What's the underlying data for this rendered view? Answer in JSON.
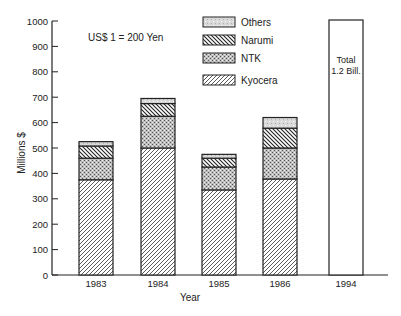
{
  "chart_data": {
    "type": "bar",
    "stacked": true,
    "title": "",
    "annotation": "US$ 1 = 200 Yen",
    "xlabel": "Year",
    "ylabel": "Millions $",
    "ylim": [
      0,
      1000
    ],
    "yticks": [
      0,
      100,
      200,
      300,
      400,
      500,
      600,
      700,
      800,
      900,
      1000
    ],
    "grid": false,
    "legend_position": "top-center",
    "categories": [
      "1983",
      "1984",
      "1985",
      "1986",
      "1994"
    ],
    "series": [
      {
        "name": "Kyocera",
        "pattern": "diagonal-hatch-right",
        "values": [
          375,
          500,
          335,
          378,
          null
        ]
      },
      {
        "name": "NTK",
        "pattern": "dotted-gray",
        "values": [
          85,
          125,
          90,
          122,
          null
        ]
      },
      {
        "name": "Narumi",
        "pattern": "diagonal-hatch-left",
        "values": [
          48,
          50,
          35,
          78,
          null
        ]
      },
      {
        "name": "Others",
        "pattern": "light-gray",
        "values": [
          17,
          20,
          15,
          42,
          null
        ]
      }
    ],
    "totals": [
      525,
      695,
      475,
      620,
      1200
    ],
    "special_bar": {
      "category": "1994",
      "label_line1": "Total",
      "label_line2": "1.2 Bill.",
      "value": 1200,
      "note": "bar extends to top of axis (exceeds scale)"
    }
  }
}
